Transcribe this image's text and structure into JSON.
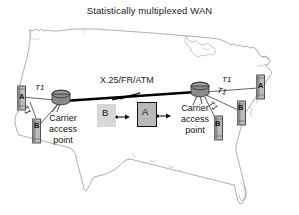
{
  "figure": {
    "title": "Statistically multiplexed WAN",
    "type": "network-topology-diagram",
    "background_map": "united-states-outline",
    "colors": {
      "background": "#ffffff",
      "map_outline": "#8a8a8a",
      "link": "#000000",
      "node_fill": "#8f8f8f",
      "packet_a_fill": "#b8b8b8",
      "packet_b_fill": "#d6d6d6",
      "text": "#111111"
    }
  },
  "labels": {
    "wan_link": "X.25/FR/ATM",
    "carrier_left": "Carrier\naccess\npoint",
    "carrier_left_lines": [
      "Carrier",
      "access",
      "point"
    ],
    "carrier_right_lines": [
      "Carrier",
      "access",
      "point"
    ],
    "t1_left_upper": "T1",
    "t1_left_lower": "T1",
    "t1_right_upper": "T1",
    "t1_right_middle": "T1",
    "t1_right_lower": "T1"
  },
  "packets": [
    {
      "id": "packet-b",
      "label": "B",
      "bordered": false
    },
    {
      "id": "packet-a",
      "label": "A",
      "bordered": true
    }
  ],
  "terminals": {
    "left": [
      {
        "id": "terminal-left-a",
        "label": "A"
      },
      {
        "id": "terminal-left-b",
        "label": "B"
      }
    ],
    "right": [
      {
        "id": "terminal-right-a",
        "label": "A"
      },
      {
        "id": "terminal-right-b",
        "label": "B"
      },
      {
        "id": "terminal-right-c",
        "label": "B"
      }
    ]
  },
  "nodes": [
    {
      "id": "carrier-access-point-left",
      "shape": "cylinder"
    },
    {
      "id": "carrier-access-point-right",
      "shape": "cylinder"
    }
  ]
}
